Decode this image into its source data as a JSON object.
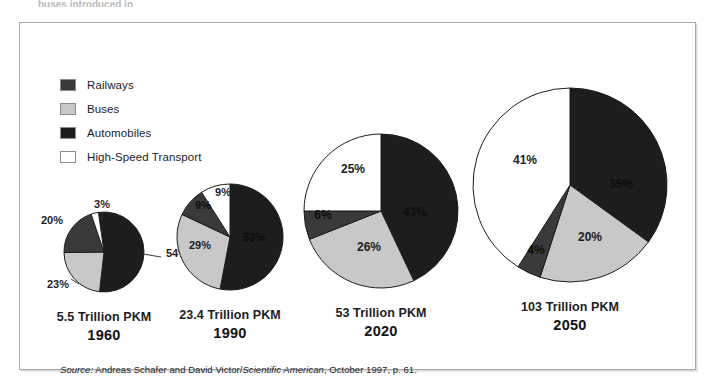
{
  "top_cutoff_text": "buses introduced in",
  "legend": {
    "items": [
      {
        "label": "Railways",
        "color": "#3a3a3a"
      },
      {
        "label": "Buses",
        "color": "#c8c8c8"
      },
      {
        "label": "Automobiles",
        "color": "#1d1d1d"
      },
      {
        "label": "High-Speed Transport",
        "color": "#ffffff"
      }
    ]
  },
  "source": {
    "prefix": "Source:",
    "authors": " Andreas Schafer and David Victor/",
    "publication": "Scientific American",
    "suffix": ", October 1997, p. 61."
  },
  "colors": {
    "railways": "#3a3a3a",
    "buses": "#c8c8c8",
    "automobiles": "#1d1d1d",
    "high_speed": "#ffffff",
    "outline": "#1d1d1f",
    "frame": "#a9a9ad"
  },
  "chart_data": {
    "type": "pie",
    "title": "",
    "subtitle": "",
    "xlabel": "",
    "ylabel": "",
    "legend_position": "top-left",
    "grid": false,
    "categories": [
      "Railways",
      "Buses",
      "Automobiles",
      "High-Speed Transport"
    ],
    "note": "Four pie charts showing modal share of passenger-kilometers; pie area scales with total PKM.",
    "pies": [
      {
        "year": "1960",
        "total_label": "5.5 Trillion PKM",
        "total_value": 5.5,
        "total_units": "Trillion PKM",
        "diameter_px": 80,
        "values": [
          20,
          23,
          54,
          3
        ],
        "slices": [
          {
            "name": "Automobiles",
            "value": 54,
            "label": "54%",
            "color": "#1d1d1d"
          },
          {
            "name": "Buses",
            "value": 23,
            "label": "23%",
            "color": "#c8c8c8"
          },
          {
            "name": "Railways",
            "value": 20,
            "label": "20%",
            "color": "#3a3a3a"
          },
          {
            "name": "High-Speed Transport",
            "value": 3,
            "label": "3%",
            "color": "#ffffff"
          }
        ]
      },
      {
        "year": "1990",
        "total_label": "23.4 Trillion PKM",
        "total_value": 23.4,
        "total_units": "Trillion PKM",
        "diameter_px": 106,
        "values": [
          9,
          29,
          53,
          9
        ],
        "slices": [
          {
            "name": "Automobiles",
            "value": 53,
            "label": "53%",
            "color": "#1d1d1d"
          },
          {
            "name": "Buses",
            "value": 29,
            "label": "29%",
            "color": "#c8c8c8"
          },
          {
            "name": "Railways",
            "value": 9,
            "label": "9%",
            "color": "#3a3a3a"
          },
          {
            "name": "High-Speed Transport",
            "value": 9,
            "label": "9%",
            "color": "#ffffff"
          }
        ]
      },
      {
        "year": "2020",
        "total_label": "53 Trillion PKM",
        "total_value": 53,
        "total_units": "Trillion PKM",
        "diameter_px": 154,
        "values": [
          6,
          26,
          43,
          25
        ],
        "slices": [
          {
            "name": "Automobiles",
            "value": 43,
            "label": "43%",
            "color": "#1d1d1d"
          },
          {
            "name": "Buses",
            "value": 26,
            "label": "26%",
            "color": "#c8c8c8"
          },
          {
            "name": "Railways",
            "value": 6,
            "label": "6%",
            "color": "#3a3a3a"
          },
          {
            "name": "High-Speed Transport",
            "value": 25,
            "label": "25%",
            "color": "#ffffff"
          }
        ]
      },
      {
        "year": "2050",
        "total_label": "103 Trillion PKM",
        "total_value": 103,
        "total_units": "Trillion PKM",
        "diameter_px": 194,
        "values": [
          4,
          20,
          35,
          41
        ],
        "slices": [
          {
            "name": "Automobiles",
            "value": 35,
            "label": "35%",
            "color": "#1d1d1d"
          },
          {
            "name": "Buses",
            "value": 20,
            "label": "20%",
            "color": "#c8c8c8"
          },
          {
            "name": "Railways",
            "value": 4,
            "label": "4%",
            "color": "#3a3a3a"
          },
          {
            "name": "High-Speed Transport",
            "value": 41,
            "label": "41%",
            "color": "#ffffff"
          }
        ]
      }
    ]
  }
}
